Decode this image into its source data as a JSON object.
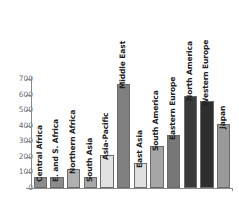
{
  "chart_data": {
    "type": "bar",
    "title": "",
    "subtitle": "",
    "xlabel": "",
    "ylabel": "",
    "ylim": [
      0,
      700
    ],
    "yticks": [
      0,
      100,
      200,
      300,
      400,
      500,
      600,
      700
    ],
    "grid": false,
    "legend": "none",
    "orientation": "vertical",
    "categories": [
      "Central Africa",
      "E. and S. Africa",
      "Northern Africa",
      "South Asia",
      "Asia-Pacific",
      "Middle East",
      "East Asia",
      "South America",
      "Eastern Europe",
      "North America",
      "Western Europe",
      "Japan"
    ],
    "values": [
      70,
      68,
      120,
      70,
      212,
      670,
      160,
      270,
      343,
      590,
      560,
      408
    ],
    "bar_colors": [
      "#8c8c8c",
      "#8c8c8c",
      "#b0b0b0",
      "#a8a8a8",
      "#e2e2e2",
      "#808080",
      "#e0e0e0",
      "#a6a6a6",
      "#777777",
      "#3a3a3a",
      "#2e2e2e",
      "#9a9a9a"
    ],
    "axis_color": "#8a8a8a",
    "tick_label_color": "#6d6d6d",
    "bar_label_color": "#222222",
    "background_color": "#ffffff"
  }
}
